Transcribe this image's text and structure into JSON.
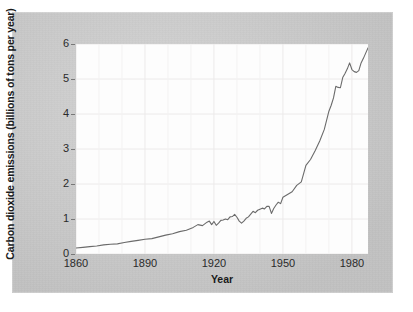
{
  "chart_data": {
    "type": "line",
    "title": "",
    "xlabel": "Year",
    "ylabel": "Carbon dioxide emissions (billions of tons per year)",
    "xlim": [
      1860,
      1987
    ],
    "ylim": [
      0,
      6
    ],
    "xticks": [
      "1860",
      "1890",
      "1920",
      "1950",
      "1980"
    ],
    "xtick_values": [
      1860,
      1890,
      1920,
      1950,
      1980
    ],
    "yticks": [
      "0",
      "1",
      "2",
      "3",
      "4",
      "5",
      "6"
    ],
    "ytick_values": [
      0,
      1,
      2,
      3,
      4,
      5,
      6
    ],
    "grid": true,
    "legend": "none",
    "line_color": "#6b6b6b",
    "series": [
      {
        "name": "Carbon dioxide emissions",
        "x": [
          1860,
          1863,
          1866,
          1869,
          1872,
          1875,
          1878,
          1881,
          1884,
          1887,
          1890,
          1893,
          1896,
          1899,
          1902,
          1905,
          1908,
          1911,
          1913,
          1915,
          1917,
          1918,
          1919,
          1920,
          1921,
          1922,
          1923,
          1924,
          1925,
          1926,
          1927,
          1928,
          1929,
          1930,
          1931,
          1932,
          1933,
          1934,
          1935,
          1936,
          1937,
          1938,
          1939,
          1940,
          1941,
          1942,
          1943,
          1944,
          1945,
          1946,
          1947,
          1948,
          1949,
          1950,
          1952,
          1954,
          1956,
          1958,
          1960,
          1962,
          1964,
          1966,
          1968,
          1970,
          1971,
          1972,
          1973,
          1974,
          1975,
          1976,
          1977,
          1978,
          1979,
          1980,
          1981,
          1982,
          1983,
          1984,
          1985,
          1986,
          1987
        ],
        "values": [
          0.17,
          0.19,
          0.21,
          0.23,
          0.26,
          0.28,
          0.29,
          0.33,
          0.36,
          0.39,
          0.42,
          0.44,
          0.49,
          0.54,
          0.58,
          0.64,
          0.68,
          0.76,
          0.84,
          0.81,
          0.91,
          0.94,
          0.84,
          0.93,
          0.82,
          0.88,
          0.96,
          0.97,
          1.0,
          0.98,
          1.06,
          1.07,
          1.13,
          1.05,
          0.94,
          0.88,
          0.94,
          1.02,
          1.06,
          1.14,
          1.22,
          1.18,
          1.25,
          1.28,
          1.31,
          1.29,
          1.36,
          1.36,
          1.16,
          1.3,
          1.4,
          1.48,
          1.44,
          1.62,
          1.7,
          1.78,
          1.96,
          2.06,
          2.53,
          2.7,
          2.95,
          3.23,
          3.56,
          4.08,
          4.25,
          4.46,
          4.79,
          4.76,
          4.75,
          5.04,
          5.16,
          5.29,
          5.46,
          5.27,
          5.21,
          5.19,
          5.24,
          5.46,
          5.59,
          5.74,
          5.89
        ]
      }
    ]
  }
}
